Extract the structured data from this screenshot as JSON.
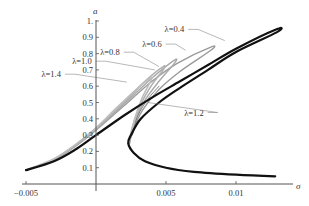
{
  "chart_data": {
    "type": "line",
    "title": "",
    "xlabel": "σ",
    "ylabel": "a",
    "xlim": [
      -0.0055,
      0.0135
    ],
    "ylim": [
      0,
      1.02
    ],
    "grid": false,
    "legend_position": "inline labels with leader lines",
    "x_ticks": [
      {
        "value": -0.005,
        "label": "−0.005"
      },
      {
        "value": 0.005,
        "label": "0.005"
      },
      {
        "value": 0.01,
        "label": "0.01"
      }
    ],
    "y_ticks": [
      {
        "value": 0.1,
        "label": "0.1"
      },
      {
        "value": 0.2,
        "label": "0.2"
      },
      {
        "value": 0.3,
        "label": "0.3"
      },
      {
        "value": 0.4,
        "label": "0.4"
      },
      {
        "value": 0.5,
        "label": "0.5"
      },
      {
        "value": 0.6,
        "label": "0.6"
      },
      {
        "value": 0.7,
        "label": "0.7"
      },
      {
        "value": 0.8,
        "label": "0.8"
      },
      {
        "value": 0.9,
        "label": "0.9"
      },
      {
        "value": 1.0,
        "label": "1."
      }
    ],
    "series": [
      {
        "name": "λ=0.4",
        "color": "#111111",
        "width": 2.2,
        "upper": [
          [
            -0.005,
            0.085
          ],
          [
            -0.003,
            0.14
          ],
          [
            -0.0015,
            0.21
          ],
          [
            0,
            0.3
          ],
          [
            0.002,
            0.42
          ],
          [
            0.004,
            0.53
          ],
          [
            0.006,
            0.63
          ],
          [
            0.008,
            0.73
          ],
          [
            0.01,
            0.83
          ],
          [
            0.0129,
            0.95
          ]
        ],
        "lower": [
          [
            0.0129,
            0.93
          ],
          [
            0.01,
            0.81
          ],
          [
            0.008,
            0.7
          ],
          [
            0.006,
            0.59
          ],
          [
            0.0045,
            0.5
          ],
          [
            0.0032,
            0.4
          ],
          [
            0.0025,
            0.3
          ],
          [
            0.0023,
            0.25
          ],
          [
            0.0027,
            0.19
          ],
          [
            0.0035,
            0.14
          ],
          [
            0.005,
            0.1
          ],
          [
            0.007,
            0.075
          ],
          [
            0.01,
            0.057
          ],
          [
            0.0128,
            0.047
          ]
        ],
        "label_pos": [
          0.0049,
          0.93
        ],
        "leader_to": [
          0.0092,
          0.88
        ]
      },
      {
        "name": "λ=0.6",
        "color": "#9a9a9a",
        "width": 1.4,
        "upper": [
          [
            -0.005,
            0.085
          ],
          [
            -0.003,
            0.15
          ],
          [
            -0.0015,
            0.23
          ],
          [
            0,
            0.33
          ],
          [
            0.002,
            0.48
          ],
          [
            0.004,
            0.63
          ],
          [
            0.0058,
            0.74
          ],
          [
            0.0082,
            0.84
          ]
        ],
        "lower": [
          [
            0.0082,
            0.82
          ],
          [
            0.006,
            0.69
          ],
          [
            0.0045,
            0.58
          ],
          [
            0.0033,
            0.45
          ],
          [
            0.0026,
            0.32
          ],
          [
            0.0024,
            0.25
          ]
        ],
        "label_pos": [
          0.0033,
          0.84
        ],
        "leader_to": [
          0.0064,
          0.82
        ]
      },
      {
        "name": "λ=0.8",
        "color": "#a8a8a8",
        "width": 1.4,
        "upper": [
          [
            -0.005,
            0.085
          ],
          [
            -0.003,
            0.15
          ],
          [
            -0.0015,
            0.23
          ],
          [
            0,
            0.335
          ],
          [
            0.002,
            0.49
          ],
          [
            0.004,
            0.65
          ],
          [
            0.0056,
            0.76
          ]
        ],
        "lower": [
          [
            0.0056,
            0.74
          ],
          [
            0.0045,
            0.63
          ],
          [
            0.0034,
            0.5
          ],
          [
            0.0027,
            0.36
          ],
          [
            0.0024,
            0.26
          ]
        ],
        "label_pos": [
          0.0003,
          0.79
        ],
        "leader_to": [
          0.0045,
          0.72
        ]
      },
      {
        "name": "λ=1.0",
        "color": "#b0b0b0",
        "width": 1.6,
        "upper": [
          [
            -0.005,
            0.085
          ],
          [
            -0.003,
            0.15
          ],
          [
            -0.0015,
            0.235
          ],
          [
            0,
            0.34
          ],
          [
            0.002,
            0.5
          ],
          [
            0.0035,
            0.63
          ],
          [
            0.0048,
            0.72
          ]
        ],
        "lower": [
          [
            0.0048,
            0.7
          ],
          [
            0.004,
            0.61
          ],
          [
            0.0032,
            0.49
          ],
          [
            0.0026,
            0.35
          ],
          [
            0.0024,
            0.26
          ]
        ],
        "label_pos": [
          -0.0017,
          0.735
        ],
        "leader_to": [
          0.0042,
          0.7
        ]
      },
      {
        "name": "λ=1.2",
        "color": "#777777",
        "width": 0.9,
        "upper": [
          [
            0.0026,
            0.3
          ],
          [
            0.003,
            0.42
          ],
          [
            0.0037,
            0.52
          ],
          [
            0.0045,
            0.6
          ]
        ],
        "lower": [],
        "label_pos": [
          0.0063,
          0.42
        ],
        "leader_to": [
          0.0037,
          0.5
        ]
      },
      {
        "name": "λ=1.4",
        "color": "#bdbdbd",
        "width": 1.6,
        "upper": [
          [
            -0.005,
            0.085
          ],
          [
            -0.003,
            0.155
          ],
          [
            -0.0015,
            0.24
          ],
          [
            0,
            0.345
          ],
          [
            0.0015,
            0.47
          ],
          [
            0.003,
            0.59
          ],
          [
            0.0039,
            0.65
          ]
        ],
        "lower": [
          [
            0.0039,
            0.63
          ],
          [
            0.0033,
            0.53
          ],
          [
            0.0028,
            0.41
          ],
          [
            0.0025,
            0.3
          ]
        ],
        "label_pos": [
          -0.0039,
          0.655
        ],
        "leader_to": [
          0.0022,
          0.625
        ]
      }
    ]
  }
}
